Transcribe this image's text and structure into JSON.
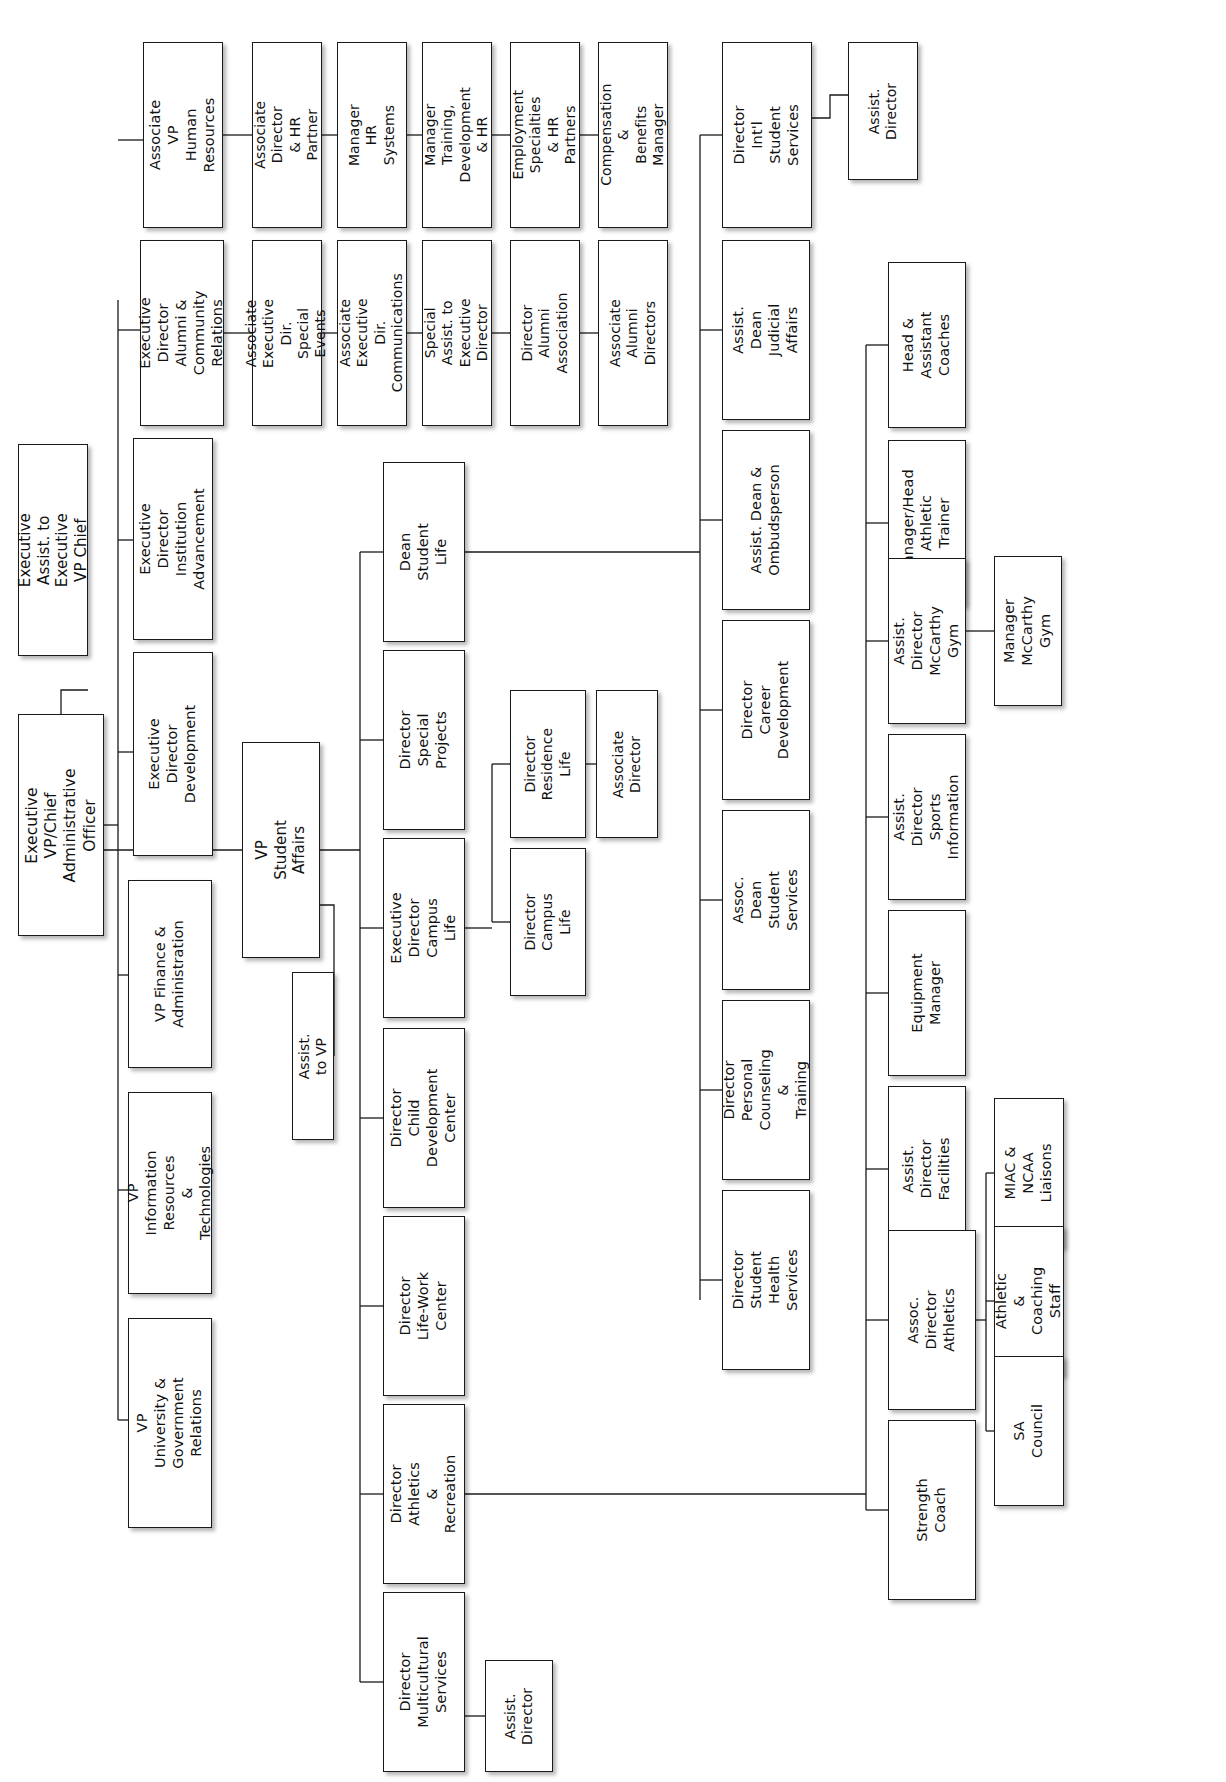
{
  "chart_data": {
    "type": "diagram",
    "orientation": "rotated-90-ccw",
    "note": "Hierarchical organization chart; all box text rendered rotated 90 degrees counter-clockwise.",
    "nodes": [
      {
        "id": "exec_vp",
        "label": "Executive VP/Chief\nAdministrative Officer",
        "x": 18,
        "y": 714,
        "w": 86,
        "h": 222,
        "size": "fs-root"
      },
      {
        "id": "exec_assist",
        "label": "Executive Assist. to\nExecutive VP Chief",
        "x": 18,
        "y": 444,
        "w": 70,
        "h": 212,
        "size": "fs-lg"
      },
      {
        "id": "vp_univ_gov",
        "label": "VP University &\nGovernment\nRelations",
        "x": 128,
        "y": 1318,
        "w": 84,
        "h": 210,
        "size": "fs-md"
      },
      {
        "id": "vp_info",
        "label": "VP Information\nResources\n& Technologies",
        "x": 128,
        "y": 1092,
        "w": 84,
        "h": 202,
        "size": "fs-md"
      },
      {
        "id": "vp_finance",
        "label": "VP Finance &\nAdministration",
        "x": 128,
        "y": 880,
        "w": 84,
        "h": 188,
        "size": "fs-md"
      },
      {
        "id": "ed_dev",
        "label": "Executive Director\nDevelopment",
        "x": 133,
        "y": 652,
        "w": 80,
        "h": 204,
        "size": "fs-md"
      },
      {
        "id": "ed_inst_adv",
        "label": "Executive Director\nInstitution\nAdvancement",
        "x": 133,
        "y": 438,
        "w": 80,
        "h": 202,
        "size": "fs-md"
      },
      {
        "id": "ed_alumni",
        "label": "Executive Director\nAlumni & Community\nRelations",
        "x": 140,
        "y": 240,
        "w": 84,
        "h": 186,
        "size": "fs-md"
      },
      {
        "id": "avp_hr",
        "label": "Associate VP\nHuman Resources",
        "x": 143,
        "y": 42,
        "w": 80,
        "h": 186,
        "size": "fs-md"
      },
      {
        "id": "assoc_dir_hr",
        "label": "Associate Director\n& HR Partner",
        "x": 252,
        "y": 42,
        "w": 70,
        "h": 186,
        "size": "fs-sm"
      },
      {
        "id": "mgr_hr_sys",
        "label": "Manager HR\nSystems",
        "x": 337,
        "y": 42,
        "w": 70,
        "h": 186,
        "size": "fs-sm"
      },
      {
        "id": "mgr_training",
        "label": "Manager Training,\nDevelopment & HR",
        "x": 422,
        "y": 42,
        "w": 70,
        "h": 186,
        "size": "fs-sm"
      },
      {
        "id": "employment",
        "label": "Employment\nSpecialties & HR\nPartners",
        "x": 510,
        "y": 42,
        "w": 70,
        "h": 186,
        "size": "fs-sm"
      },
      {
        "id": "comp_benefits",
        "label": "Compensation &\nBenefits Manager",
        "x": 598,
        "y": 42,
        "w": 70,
        "h": 186,
        "size": "fs-sm"
      },
      {
        "id": "assoc_exec_se",
        "label": "Associate Executive\nDir. Special Events",
        "x": 252,
        "y": 240,
        "w": 70,
        "h": 186,
        "size": "fs-sm"
      },
      {
        "id": "assoc_exec_co",
        "label": "Associate Executive\nDir. Communications",
        "x": 337,
        "y": 240,
        "w": 70,
        "h": 186,
        "size": "fs-sm"
      },
      {
        "id": "spec_assist",
        "label": "Special Assist. to\nExecutive Director",
        "x": 422,
        "y": 240,
        "w": 70,
        "h": 186,
        "size": "fs-sm"
      },
      {
        "id": "dir_alumni_as",
        "label": "Director\nAlumni Association",
        "x": 510,
        "y": 240,
        "w": 70,
        "h": 186,
        "size": "fs-sm"
      },
      {
        "id": "assoc_alumni",
        "label": "Associate Alumni\nDirectors",
        "x": 598,
        "y": 240,
        "w": 70,
        "h": 186,
        "size": "fs-sm"
      },
      {
        "id": "dir_intl",
        "label": "Director\nInt'l\nStudent Services",
        "x": 722,
        "y": 42,
        "w": 90,
        "h": 186,
        "size": "fs-md"
      },
      {
        "id": "intl_assist",
        "label": "Assist.\nDirector",
        "x": 848,
        "y": 42,
        "w": 70,
        "h": 138,
        "size": "fs-sm"
      },
      {
        "id": "vp_student",
        "label": "VP Student\nAffairs",
        "x": 242,
        "y": 742,
        "w": 78,
        "h": 216,
        "size": "fs-lg"
      },
      {
        "id": "assist_to_vp",
        "label": "Assist. to VP",
        "x": 292,
        "y": 972,
        "w": 42,
        "h": 168,
        "size": "fs-sm"
      },
      {
        "id": "dean_sl",
        "label": "Dean\nStudent\nLife",
        "x": 383,
        "y": 462,
        "w": 82,
        "h": 180,
        "size": "fs-md"
      },
      {
        "id": "dir_special",
        "label": "Director\nSpecial\nProjects",
        "x": 383,
        "y": 650,
        "w": 82,
        "h": 180,
        "size": "fs-md"
      },
      {
        "id": "ed_campus",
        "label": "Executive\nDirector\nCampus Life",
        "x": 383,
        "y": 838,
        "w": 82,
        "h": 180,
        "size": "fs-md"
      },
      {
        "id": "dir_child",
        "label": "Director\nChild\nDevelopment\nCenter",
        "x": 383,
        "y": 1028,
        "w": 82,
        "h": 180,
        "size": "fs-md"
      },
      {
        "id": "dir_lifework",
        "label": "Director\nLife-Work\nCenter",
        "x": 383,
        "y": 1216,
        "w": 82,
        "h": 180,
        "size": "fs-md"
      },
      {
        "id": "dir_athletics",
        "label": "Director\nAthletics\n& Recreation",
        "x": 383,
        "y": 1404,
        "w": 82,
        "h": 180,
        "size": "fs-md"
      },
      {
        "id": "dir_multicult",
        "label": "Director\nMulticultural\nServices",
        "x": 383,
        "y": 1592,
        "w": 82,
        "h": 180,
        "size": "fs-md"
      },
      {
        "id": "multicult_ast",
        "label": "Assist.\nDirector",
        "x": 485,
        "y": 1660,
        "w": 68,
        "h": 112,
        "size": "fs-sm"
      },
      {
        "id": "dir_residence",
        "label": "Director\nResidence Life",
        "x": 510,
        "y": 690,
        "w": 76,
        "h": 148,
        "size": "fs-sm"
      },
      {
        "id": "res_assoc_dir",
        "label": "Associate\nDirector",
        "x": 596,
        "y": 690,
        "w": 62,
        "h": 148,
        "size": "fs-sm"
      },
      {
        "id": "dir_campus",
        "label": "Director\nCampus Life",
        "x": 510,
        "y": 848,
        "w": 76,
        "h": 148,
        "size": "fs-sm"
      },
      {
        "id": "assist_dean_j",
        "label": "Assist. Dean\nJudicial Affairs",
        "x": 722,
        "y": 240,
        "w": 88,
        "h": 180,
        "size": "fs-md"
      },
      {
        "id": "assist_dean_o",
        "label": "Assist. Dean &\nOmbudsperson",
        "x": 722,
        "y": 430,
        "w": 88,
        "h": 180,
        "size": "fs-md"
      },
      {
        "id": "dir_career",
        "label": "Director\nCareer\nDevelopment",
        "x": 722,
        "y": 620,
        "w": 88,
        "h": 180,
        "size": "fs-md"
      },
      {
        "id": "assoc_dean_ss",
        "label": "Assoc. Dean\nStudent\nServices",
        "x": 722,
        "y": 810,
        "w": 88,
        "h": 180,
        "size": "fs-md"
      },
      {
        "id": "dir_personal",
        "label": "Director\nPersonal\nCounseling &\nTraining",
        "x": 722,
        "y": 1000,
        "w": 88,
        "h": 180,
        "size": "fs-md"
      },
      {
        "id": "dir_health",
        "label": "Director\nStudent\nHealth Services",
        "x": 722,
        "y": 1190,
        "w": 88,
        "h": 180,
        "size": "fs-md"
      },
      {
        "id": "head_coaches",
        "label": "Head &\nAssistant\nCoaches",
        "x": 888,
        "y": 262,
        "w": 78,
        "h": 166,
        "size": "fs-md"
      },
      {
        "id": "mgr_trainer",
        "label": "Manager/Head\nAthletic Trainer",
        "x": 888,
        "y": 440,
        "w": 78,
        "h": 166,
        "size": "fs-md"
      },
      {
        "id": "ad_mccarthy",
        "label": "Assist. Director\nMcCarthy\nGym",
        "x": 888,
        "y": 558,
        "w": 78,
        "h": 166,
        "size": "fs-md"
      },
      {
        "id": "mgr_mccarthy",
        "label": "Manager\nMcCarthy Gym",
        "x": 994,
        "y": 556,
        "w": 68,
        "h": 150,
        "size": "fs-md"
      },
      {
        "id": "ad_sports",
        "label": "Assist. Director\nSports\nInformation",
        "x": 888,
        "y": 734,
        "w": 78,
        "h": 166,
        "size": "fs-md"
      },
      {
        "id": "equip_mgr",
        "label": "Equipment\nManager",
        "x": 888,
        "y": 910,
        "w": 78,
        "h": 166,
        "size": "fs-md"
      },
      {
        "id": "ad_facilities",
        "label": "Assist. Director\nFacilities",
        "x": 888,
        "y": 1086,
        "w": 78,
        "h": 166,
        "size": "fs-md"
      },
      {
        "id": "assoc_dir_ath",
        "label": "Assoc. Director\nAthletics",
        "x": 888,
        "y": 1230,
        "w": 88,
        "h": 180,
        "size": "fs-md"
      },
      {
        "id": "strength",
        "label": "Strength\nCoach",
        "x": 888,
        "y": 1420,
        "w": 88,
        "h": 180,
        "size": "fs-md"
      },
      {
        "id": "miac_ncaa",
        "label": "MIAC & NCAA\nLiaisons",
        "x": 994,
        "y": 1098,
        "w": 70,
        "h": 150,
        "size": "fs-md"
      },
      {
        "id": "athletic_staff",
        "label": "Athletic &\nCoaching Staff",
        "x": 994,
        "y": 1226,
        "w": 70,
        "h": 150,
        "size": "fs-md"
      },
      {
        "id": "sa_council",
        "label": "SA Council",
        "x": 994,
        "y": 1356,
        "w": 70,
        "h": 150,
        "size": "fs-md"
      }
    ],
    "connector_color": "#1a1a1a",
    "box_fill": "#ffffff",
    "box_border": "#1a1a1a"
  }
}
